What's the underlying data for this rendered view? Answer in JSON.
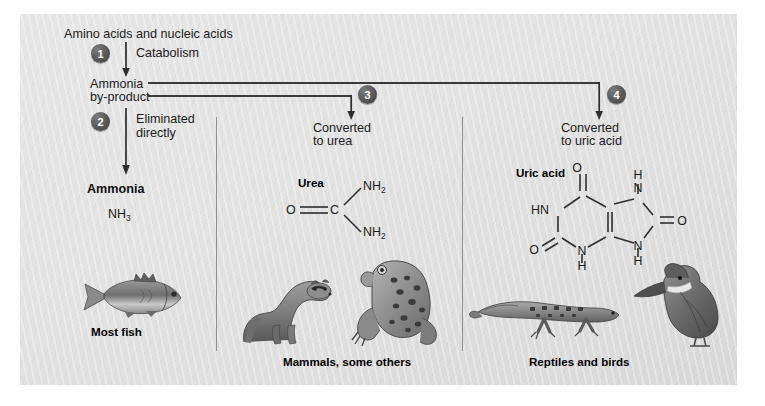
{
  "figure": {
    "source_label": "Amino acids and nucleic acids",
    "background_hex": "#e2e2e2",
    "badge_hex": "#4a4a4a",
    "line_hex": "#3a3a3a"
  },
  "top": {
    "start_label": "Amino acids and nucleic acids",
    "step1_number": "1",
    "step1_label": "Catabolism",
    "intermediate_line1": "Ammonia",
    "intermediate_line2": "by-product"
  },
  "branches": [
    {
      "number": "2",
      "action_line1": "Eliminated",
      "action_line2": "directly",
      "product_name": "Ammonia",
      "formula": "NH3",
      "formula_base": "NH",
      "formula_sub": "3",
      "organisms_label": "Most fish",
      "animals": [
        "fish"
      ]
    },
    {
      "number": "3",
      "action_line1": "Converted",
      "action_line2": "to urea",
      "product_name": "Urea",
      "formula": "O=C(NH2)2",
      "atoms": [
        "O",
        "C",
        "NH2",
        "NH2"
      ],
      "organisms_label": "Mammals, some others",
      "animals": [
        "ferret",
        "frog"
      ]
    },
    {
      "number": "4",
      "action_line1": "Converted",
      "action_line2": "to uric acid",
      "product_name": "Uric acid",
      "formula": "C5H4N4O3",
      "atoms": [
        "O",
        "HN",
        "O",
        "N",
        "H",
        "N",
        "H",
        "N",
        "H",
        "O"
      ],
      "organisms_label": "Reptiles and birds",
      "animals": [
        "lizard",
        "kingfisher"
      ]
    }
  ]
}
